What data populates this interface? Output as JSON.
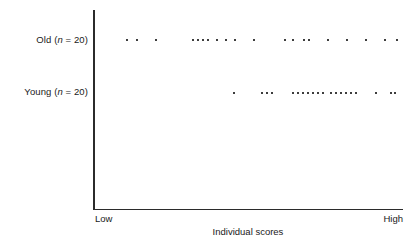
{
  "figure": {
    "type": "dot-plot",
    "background_color": "#ffffff",
    "axis_color": "#2b2b2b",
    "dot_color": "#3d3d3d"
  },
  "axis": {
    "x_title": "Individual scores",
    "x_low_label": "Low",
    "x_high_label": "High"
  },
  "rows": [
    {
      "id": "old",
      "label_prefix": "Old (",
      "label_italic": "n",
      "label_suffix": " = 20)",
      "label_full": "Old (n = 20)"
    },
    {
      "id": "young",
      "label_prefix": "Young (",
      "label_italic": "n",
      "label_suffix": " = 20)",
      "label_full": "Young (n = 20)"
    }
  ],
  "chart_data": {
    "type": "scatter",
    "title": "",
    "subtitle": "",
    "xlabel": "Individual scores",
    "ylabel": "",
    "grid": false,
    "legend": "none",
    "xlim": [
      0,
      100
    ],
    "xtick_labels": [
      "Low",
      "High"
    ],
    "ytick_labels": [
      "Old (n = 20)",
      "Young (n = 20)"
    ],
    "series": [
      {
        "name": "Old (n = 20)",
        "n": 20,
        "y_px": 39,
        "x_px": [
          126,
          136,
          155,
          192,
          197,
          202,
          207,
          216,
          225,
          234,
          253,
          284,
          292,
          303,
          308,
          327,
          346,
          365,
          384,
          396
        ]
      },
      {
        "name": "Young (n = 20)",
        "n": 20,
        "y_px": 92,
        "x_px": [
          233,
          261,
          266,
          271,
          292,
          297,
          302,
          307,
          312,
          317,
          322,
          330,
          335,
          340,
          345,
          350,
          355,
          375,
          390,
          394
        ]
      }
    ]
  }
}
